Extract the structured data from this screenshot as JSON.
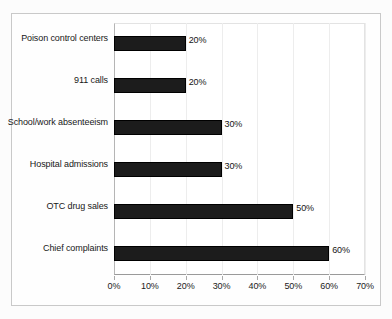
{
  "chart_data": {
    "type": "bar",
    "orientation": "horizontal",
    "title": "",
    "subtitle": "",
    "xlabel": "",
    "ylabel": "",
    "categories": [
      "Poison control centers",
      "911 calls",
      "School/work absenteeism",
      "Hospital admissions",
      "OTC drug sales",
      "Chief complaints"
    ],
    "values": [
      20,
      20,
      30,
      30,
      50,
      60
    ],
    "value_labels": [
      "20%",
      "20%",
      "30%",
      "30%",
      "50%",
      "60%"
    ],
    "xlim": [
      0,
      70
    ],
    "xticks": [
      0,
      10,
      20,
      30,
      40,
      50,
      60,
      70
    ],
    "xtick_labels": [
      "0%",
      "10%",
      "20%",
      "30%",
      "40%",
      "50%",
      "60%",
      "70%"
    ],
    "grid": false,
    "legend": null,
    "bar_color": "#1c1c1c",
    "plot_background": "#ffffff",
    "figure_border_color": "#c9c9c9"
  }
}
